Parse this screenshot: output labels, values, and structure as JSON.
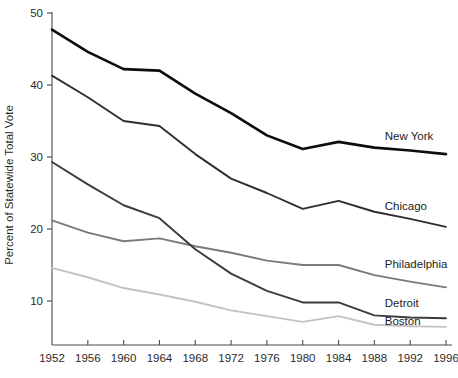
{
  "chart_data": {
    "type": "line",
    "title": "",
    "subtitle": "",
    "xlabel": "",
    "ylabel": "Percent of Statewide Total Vote",
    "x": [
      1952,
      1956,
      1960,
      1964,
      1968,
      1972,
      1976,
      1980,
      1984,
      1988,
      1992,
      1996
    ],
    "xtick_labels": [
      "1952",
      "1956",
      "1960",
      "1964",
      "1968",
      "1972",
      "1976",
      "1980",
      "1984",
      "1988",
      "1992",
      "1996"
    ],
    "ytick_labels": [
      "10",
      "20",
      "30",
      "40",
      "50"
    ],
    "yticks": [
      10,
      20,
      30,
      40,
      50
    ],
    "xlim": [
      1952,
      1996
    ],
    "ylim": [
      5.5,
      50
    ],
    "grid": false,
    "legend_position": "right-inline",
    "series": [
      {
        "name": "New York",
        "color": "#0d0d0d",
        "width": 2.6,
        "label": "New York",
        "label_x": 1994.3,
        "label_y": 32.4,
        "values": [
          47.7,
          44.6,
          42.2,
          42.0,
          38.8,
          36.1,
          33.0,
          31.1,
          32.1,
          31.3,
          30.9,
          30.4
        ]
      },
      {
        "name": "Chicago",
        "color": "#2e2e2e",
        "width": 1.9,
        "label": "Chicago",
        "label_x": 1994.3,
        "label_y": 22.6,
        "values": [
          41.3,
          38.3,
          35.0,
          34.3,
          30.4,
          27.0,
          25.0,
          22.8,
          23.9,
          22.4,
          21.4,
          20.3
        ]
      },
      {
        "name": "Philadelphia",
        "color": "#7a7a7a",
        "width": 1.9,
        "label": "Philadelphia",
        "label_x": 1994.3,
        "label_y": 14.6,
        "values": [
          21.2,
          19.5,
          18.3,
          18.7,
          17.6,
          16.7,
          15.6,
          15.0,
          15.0,
          13.6,
          12.7,
          11.9
        ]
      },
      {
        "name": "Detroit",
        "color": "#3b3b3b",
        "width": 1.9,
        "label": "Detroit",
        "label_x": 1994.3,
        "label_y": 9.2,
        "values": [
          29.3,
          26.2,
          23.3,
          21.5,
          17.2,
          13.8,
          11.4,
          9.8,
          9.8,
          8.0,
          7.7,
          7.6
        ]
      },
      {
        "name": "Boston",
        "color": "#c3c3c3",
        "width": 1.9,
        "label": "Boston",
        "label_x": 1994.3,
        "label_y": 6.6,
        "values": [
          14.6,
          13.3,
          11.8,
          10.9,
          9.9,
          8.7,
          7.9,
          7.1,
          7.9,
          6.7,
          6.5,
          6.4
        ]
      }
    ]
  }
}
